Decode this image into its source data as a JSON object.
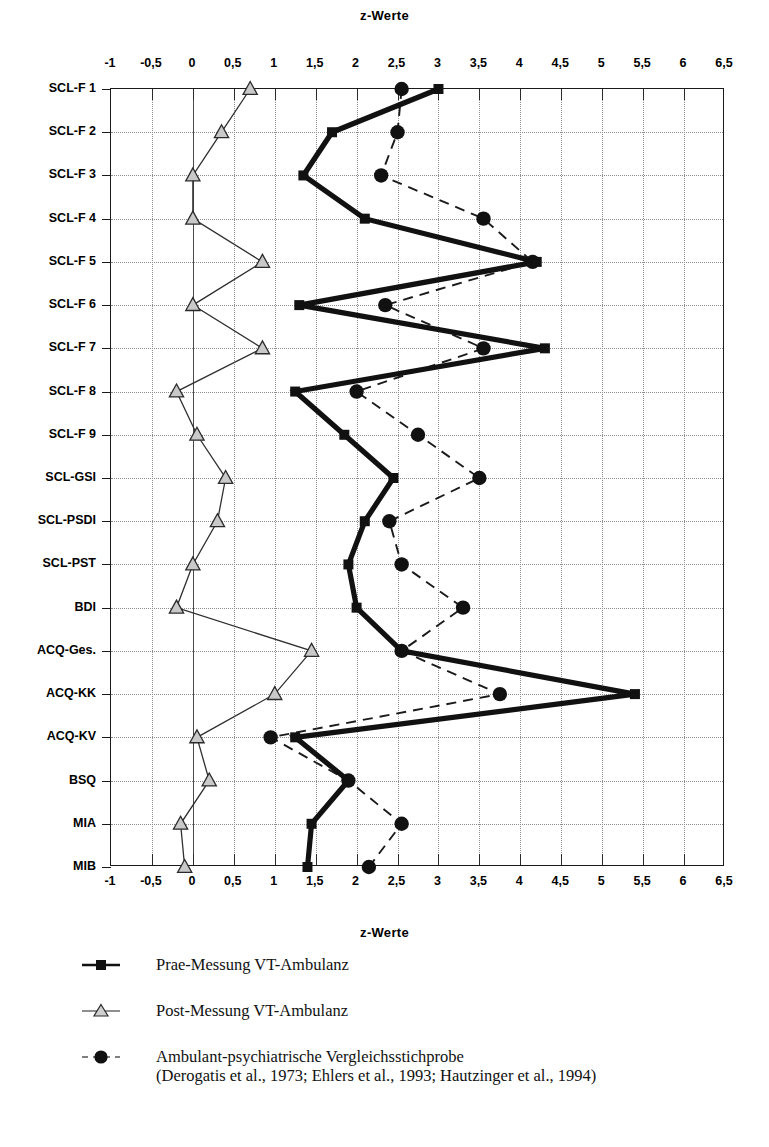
{
  "chart_data": {
    "type": "line",
    "orientation": "horizontal",
    "title": "z-Werte",
    "xlabel": "z-Werte",
    "ylabel": "",
    "xlim": [
      -1,
      6.5
    ],
    "xticks": [
      "-1",
      "-0,5",
      "0",
      "0,5",
      "1",
      "1,5",
      "2",
      "2,5",
      "3",
      "3,5",
      "4",
      "4,5",
      "5",
      "5,5",
      "6",
      "6,5"
    ],
    "xtick_values": [
      -1,
      -0.5,
      0,
      0.5,
      1,
      1.5,
      2,
      2.5,
      3,
      3.5,
      4,
      4.5,
      5,
      5.5,
      6,
      6.5
    ],
    "grid": true,
    "legend_position": "below",
    "categories": [
      "SCL-F 1",
      "SCL-F 2",
      "SCL-F 3",
      "SCL-F 4",
      "SCL-F 5",
      "SCL-F 6",
      "SCL-F 7",
      "SCL-F 8",
      "SCL-F 9",
      "SCL-GSI",
      "SCL-PSDI",
      "SCL-PST",
      "BDI",
      "ACQ-Ges.",
      "ACQ-KK",
      "ACQ-KV",
      "BSQ",
      "MIA",
      "MIB"
    ],
    "series": [
      {
        "name": "Prae-Messung VT-Ambulanz",
        "marker": "square",
        "style": "solid-thick",
        "values": [
          3.0,
          1.7,
          1.35,
          2.1,
          4.2,
          1.3,
          4.3,
          1.25,
          1.85,
          2.45,
          2.1,
          1.9,
          2.0,
          2.55,
          5.4,
          1.25,
          1.9,
          1.45,
          1.4
        ]
      },
      {
        "name": "Post-Messung VT-Ambulanz",
        "marker": "triangle",
        "style": "solid-thin",
        "values": [
          0.7,
          0.35,
          0.0,
          0.0,
          0.85,
          0.0,
          0.85,
          -0.2,
          0.05,
          0.4,
          0.3,
          0.0,
          -0.2,
          1.45,
          1.0,
          0.05,
          0.2,
          -0.15,
          -0.1
        ]
      },
      {
        "name": "Ambulant-psychiatrische Vergleichsstichprobe",
        "marker": "circle",
        "style": "dashed",
        "values": [
          2.55,
          2.5,
          2.3,
          3.55,
          4.15,
          2.35,
          3.55,
          2.0,
          2.75,
          3.5,
          2.4,
          2.55,
          3.3,
          2.55,
          3.75,
          0.95,
          1.9,
          2.55,
          2.15
        ]
      }
    ]
  },
  "legend": {
    "items": [
      {
        "marker": "square",
        "label": "Prae-Messung VT-Ambulanz",
        "sub": ""
      },
      {
        "marker": "triangle",
        "label": "Post-Messung VT-Ambulanz",
        "sub": ""
      },
      {
        "marker": "circle",
        "label": "Ambulant-psychiatrische Vergleichsstichprobe",
        "sub": "(Derogatis et al., 1973; Ehlers et al., 1993; Hautzinger et al., 1994)"
      }
    ]
  },
  "colors": {
    "ink": "#111111",
    "grid": "#8d8d8d",
    "axis": "#1a1a1a",
    "marker_fill_light": "#c9c9c9"
  }
}
